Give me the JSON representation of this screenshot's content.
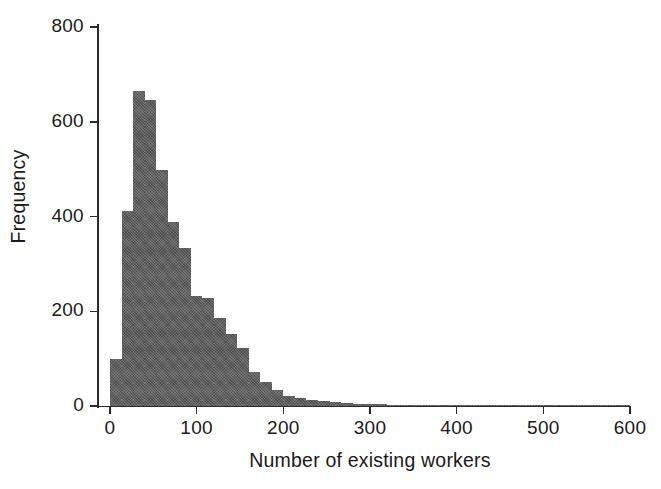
{
  "chart_data": {
    "type": "bar",
    "title": "",
    "subtitle": "",
    "xlabel": "Number of existing workers",
    "ylabel": "Frequency",
    "xlim": [
      0,
      600
    ],
    "ylim": [
      0,
      800
    ],
    "xticks": [
      0,
      100,
      200,
      300,
      400,
      500,
      600
    ],
    "yticks": [
      0,
      200,
      400,
      600,
      800
    ],
    "grid": false,
    "legend": null,
    "bar_color": "#5c5c5c",
    "bin_width": 13.3,
    "bin_starts": [
      0,
      13.3,
      26.7,
      40,
      53.3,
      66.7,
      80,
      93.3,
      106.7,
      120,
      133.3,
      146.7,
      160,
      173.3,
      186.7,
      200,
      213.3,
      226.7,
      240,
      253.3,
      266.7,
      280,
      293.3,
      306.7,
      320,
      333.3,
      346.7,
      360,
      373.3,
      386.7,
      400,
      413.3,
      426.7,
      440,
      453.3,
      466.7,
      480,
      493.3,
      506.7,
      520,
      533.3,
      546.7,
      560,
      573.3,
      586.7
    ],
    "categories": [
      "0-13",
      "13-27",
      "27-40",
      "40-53",
      "53-67",
      "67-80",
      "80-93",
      "93-107",
      "107-120",
      "120-133",
      "133-147",
      "147-160",
      "160-173",
      "173-187",
      "187-200",
      "200-213",
      "213-227",
      "227-240",
      "240-253",
      "253-267",
      "267-280",
      "280-293",
      "293-307",
      "307-320",
      "320-333",
      "333-347",
      "347-360",
      "360-373",
      "373-387",
      "387-400",
      "400-413",
      "413-427",
      "427-440",
      "440-453",
      "453-467",
      "467-480",
      "480-493",
      "493-507",
      "507-520",
      "520-533",
      "533-547",
      "547-560",
      "560-573",
      "573-587",
      "587-600"
    ],
    "values": [
      100,
      412,
      665,
      645,
      498,
      388,
      333,
      232,
      228,
      186,
      152,
      122,
      72,
      50,
      34,
      21,
      16,
      13,
      11,
      9,
      6,
      5,
      4,
      4,
      3,
      3,
      2,
      2,
      2,
      2,
      2,
      1,
      1,
      1,
      1,
      1,
      1,
      1,
      1,
      1,
      1,
      1,
      1,
      1,
      1
    ]
  }
}
